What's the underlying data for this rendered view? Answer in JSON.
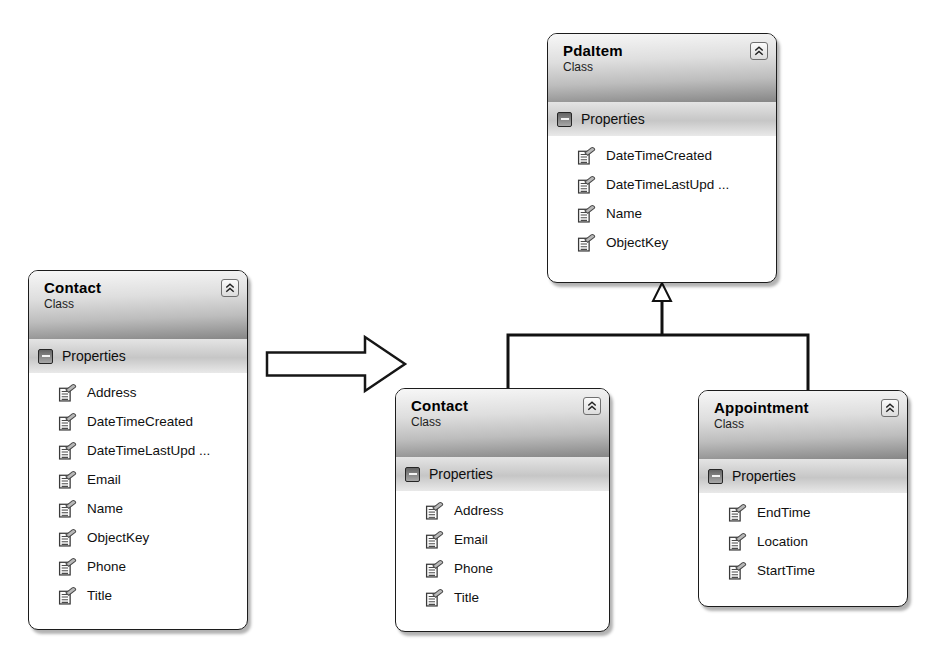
{
  "diagram": {
    "type": "uml-class-diagram",
    "background": "#ffffff",
    "colors": {
      "box_border": "#1c1c1c",
      "box_fill": "#ffffff",
      "header_gradient_top": "#f7f7f7",
      "header_gradient_bottom": "#868686",
      "section_band_mid": "#c6c6c6",
      "connector": "#111111",
      "shadow": "#b5b5b5"
    },
    "classes": [
      {
        "id": "contact-source",
        "title": "Contact",
        "stereotype": "Class",
        "section_label": "Properties",
        "members": [
          "Address",
          "DateTimeCreated",
          "DateTimeLastUpd ...",
          "Email",
          "Name",
          "ObjectKey",
          "Phone",
          "Title"
        ]
      },
      {
        "id": "pdaitem",
        "title": "PdaItem",
        "stereotype": "Class",
        "section_label": "Properties",
        "members": [
          "DateTimeCreated",
          "DateTimeLastUpd ...",
          "Name",
          "ObjectKey"
        ]
      },
      {
        "id": "contact-derived",
        "title": "Contact",
        "stereotype": "Class",
        "section_label": "Properties",
        "members": [
          "Address",
          "Email",
          "Phone",
          "Title"
        ]
      },
      {
        "id": "appointment",
        "title": "Appointment",
        "stereotype": "Class",
        "section_label": "Properties",
        "members": [
          "EndTime",
          "Location",
          "StartTime"
        ]
      }
    ],
    "relationships": {
      "inheritance": [
        {
          "from": "Contact",
          "to": "PdaItem"
        },
        {
          "from": "Appointment",
          "to": "PdaItem"
        }
      ],
      "transform_arrow": {
        "from": "contact-source",
        "to": "derived-model",
        "direction": "right"
      }
    }
  }
}
